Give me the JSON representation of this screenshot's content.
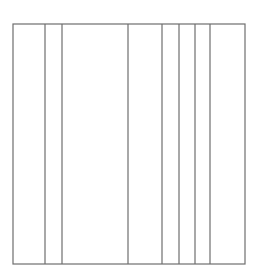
{
  "diagram": {
    "type": "rectangle-with-vertical-dividers",
    "frame": {
      "x1": 13,
      "y1": 24,
      "x2": 245,
      "y2": 264
    },
    "dividers_x": [
      45,
      62,
      128,
      162,
      179,
      195,
      210
    ],
    "stroke_color": "#6e6e6e",
    "background_color": "#ffffff",
    "column_count": 8
  }
}
